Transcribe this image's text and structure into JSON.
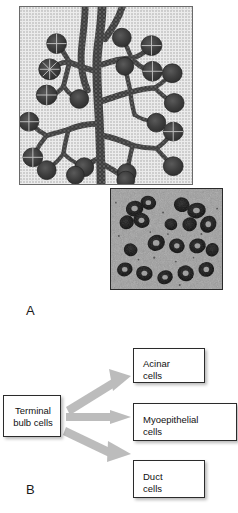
{
  "figure": {
    "panels": [
      {
        "letter": "A",
        "name": "salivary-gland-branching-diagram",
        "content": "Line drawing of a branching salivary gland duct system with terminal bulbs/acini, plus a histology micrograph inset"
      },
      {
        "letter": "B",
        "name": "cell-fate-flow-diagram",
        "content": "Flow diagram of terminal bulb cell differentiation"
      }
    ]
  },
  "panel_a": {
    "letter": "A",
    "drawing": {
      "name": "branching-duct-tree-illustration",
      "description": "stippled illustration of branched ducts ending in grape-like terminal bulbs"
    },
    "micrograph": {
      "name": "histology-micrograph-inset",
      "description": "grayscale tissue section showing clustered dark-stained acini"
    }
  },
  "panel_b": {
    "letter": "B",
    "source_box": {
      "id": "terminal-bulb-cells",
      "label": "Terminal\nbulb cells"
    },
    "target_boxes": [
      {
        "id": "acinar-cells",
        "label": "Acinar\ncells"
      },
      {
        "id": "myoepithelial-cells",
        "label": "Myoepithelial\ncells"
      },
      {
        "id": "duct-cells",
        "label": "Duct\ncells"
      }
    ],
    "arrows": [
      {
        "id": "arrow-to-acinar",
        "from": "terminal-bulb-cells",
        "to": "acinar-cells",
        "direction": "up-right"
      },
      {
        "id": "arrow-to-myoepithelial",
        "from": "terminal-bulb-cells",
        "to": "myoepithelial-cells",
        "direction": "right"
      },
      {
        "id": "arrow-to-duct",
        "from": "terminal-bulb-cells",
        "to": "duct-cells",
        "direction": "down-right"
      }
    ]
  },
  "colors": {
    "background": "#ffffff",
    "box_border": "#2b2b2b",
    "box_fill": "#ffffff",
    "arrow_fill": "#b8b8b8",
    "text": "#111111",
    "drawing_frame": "#6a6a6a",
    "drawing_bg": "#ececec",
    "duct_dark": "#3a3a3a"
  }
}
